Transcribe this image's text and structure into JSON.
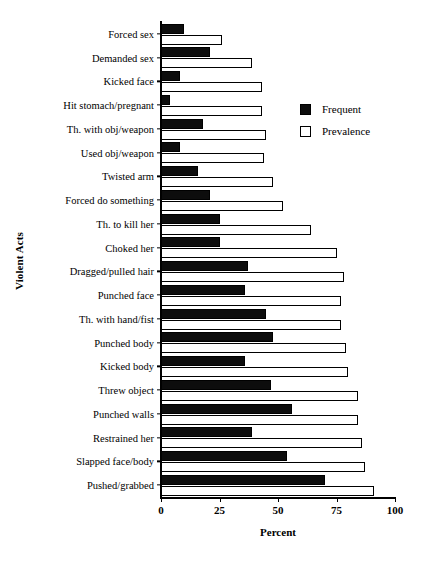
{
  "chart_data": {
    "type": "bar",
    "orientation": "horizontal",
    "title": "",
    "xlabel": "Percent",
    "ylabel": "Violent Acts",
    "xlim": [
      0,
      100
    ],
    "xticks": [
      0,
      25,
      50,
      75,
      100
    ],
    "xtick_labels": [
      "0",
      "25",
      "50",
      "75",
      "100"
    ],
    "grid": false,
    "legend_position": "upper right",
    "categories": [
      "Forced sex",
      "Demanded sex",
      "Kicked face",
      "Hit stomach/pregnant",
      "Th. with obj/weapon",
      "Used obj/weapon",
      "Twisted arm",
      "Forced do something",
      "Th. to kill her",
      "Choked her",
      "Dragged/pulled hair",
      "Punched face",
      "Th. with hand/fist",
      "Punched body",
      "Kicked body",
      "Threw object",
      "Punched walls",
      "Restrained her",
      "Slapped face/body",
      "Pushed/grabbed"
    ],
    "series": [
      {
        "name": "Frequent",
        "color": "#0d0d0d",
        "values": [
          10,
          21,
          8,
          4,
          18,
          8,
          16,
          21,
          25,
          25,
          37,
          36,
          45,
          48,
          36,
          47,
          56,
          39,
          54,
          70
        ]
      },
      {
        "name": "Prevalence",
        "color": "#ffffff",
        "values": [
          26,
          39,
          43,
          43,
          45,
          44,
          48,
          52,
          64,
          75,
          78,
          77,
          77,
          79,
          80,
          84,
          84,
          86,
          87,
          91
        ]
      }
    ]
  },
  "legend": {
    "items": [
      {
        "label": "Frequent",
        "swatch": "filled-square"
      },
      {
        "label": "Prevalence",
        "swatch": "open-square"
      }
    ]
  },
  "axes": {
    "x_title": "Percent",
    "y_title": "Violent Acts"
  }
}
